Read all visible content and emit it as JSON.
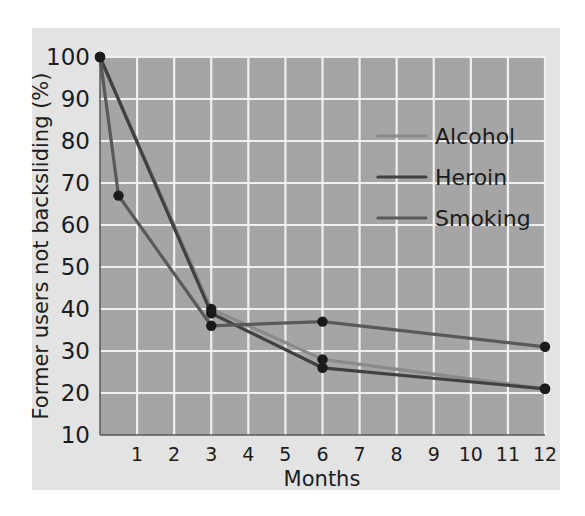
{
  "figure": {
    "background_color": "#e3e3e3",
    "plot_background_color": "#a5a5a5",
    "gridline_color": "#f0f0f0"
  },
  "chart_data": {
    "type": "line",
    "title": "",
    "subtitle": "",
    "xlabel": "Months",
    "ylabel": "Former users not backsliding (%)",
    "xlim": [
      0,
      12
    ],
    "ylim": [
      10,
      100
    ],
    "x_ticks": [
      1,
      2,
      3,
      4,
      5,
      6,
      7,
      8,
      9,
      10,
      11,
      12
    ],
    "x_tick_labels": [
      "1",
      "2",
      "3",
      "4",
      "5",
      "6",
      "7",
      "8",
      "9",
      "10",
      "11",
      "12"
    ],
    "y_ticks": [
      10,
      20,
      30,
      40,
      50,
      60,
      70,
      80,
      90,
      100
    ],
    "y_tick_labels": [
      "10",
      "20",
      "30",
      "40",
      "50",
      "60",
      "70",
      "80",
      "90",
      "100"
    ],
    "grid": true,
    "legend_position": "upper right",
    "series": [
      {
        "name": "Alcohol",
        "color": "#8a8a8a",
        "x": [
          0,
          3,
          6,
          12
        ],
        "y": [
          100,
          40,
          28,
          21
        ],
        "markers": [
          {
            "x": 0,
            "y": 100
          },
          {
            "x": 3,
            "y": 40
          },
          {
            "x": 6,
            "y": 28
          },
          {
            "x": 12,
            "y": 21
          }
        ]
      },
      {
        "name": "Heroin",
        "color": "#404040",
        "x": [
          0,
          3,
          6,
          12
        ],
        "y": [
          100,
          39,
          26,
          21
        ],
        "markers": [
          {
            "x": 0,
            "y": 100
          },
          {
            "x": 3,
            "y": 39
          },
          {
            "x": 6,
            "y": 26
          },
          {
            "x": 12,
            "y": 21
          }
        ]
      },
      {
        "name": "Smoking",
        "color": "#595959",
        "x": [
          0,
          0.5,
          3,
          6,
          12
        ],
        "y": [
          100,
          67,
          36,
          37,
          31
        ],
        "markers": [
          {
            "x": 0,
            "y": 100
          },
          {
            "x": 0.5,
            "y": 67
          },
          {
            "x": 3,
            "y": 36
          },
          {
            "x": 6,
            "y": 37
          },
          {
            "x": 12,
            "y": 31
          }
        ]
      }
    ],
    "legend_entries": [
      {
        "label": "Alcohol",
        "color": "#8a8a8a"
      },
      {
        "label": "Heroin",
        "color": "#404040"
      },
      {
        "label": "Smoking",
        "color": "#595959"
      }
    ]
  }
}
